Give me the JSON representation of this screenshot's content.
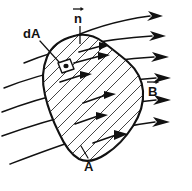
{
  "figure": {
    "type": "physics-diagram",
    "background_color": "#ffffff",
    "ink_color": "#111111",
    "width": 192,
    "height": 191
  },
  "labels": {
    "area_element": "dA",
    "normal_vector": "n",
    "field_vector": "B",
    "surface_area": "A"
  },
  "elements": {
    "surface_name": "hatched-surface-region",
    "area_element_name": "area-element-patch",
    "normal_name": "normal-vector",
    "field_lines_name": "magnetic-field-lines",
    "leader_dA_name": "leader-line-dA",
    "leader_A_name": "leader-line-A"
  },
  "counts": {
    "field_lines": 6,
    "interior_arrows": 6,
    "hatch_lines": 20
  }
}
